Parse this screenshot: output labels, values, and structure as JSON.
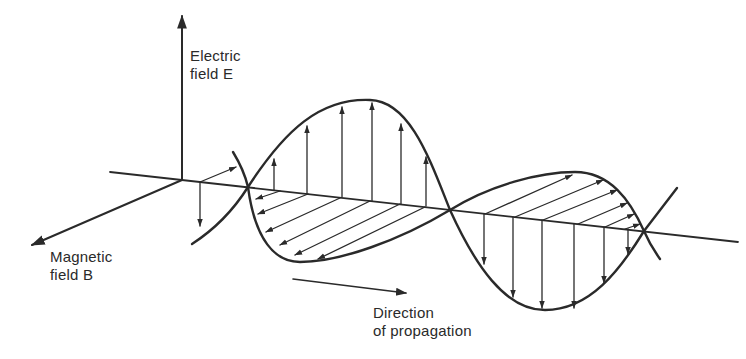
{
  "figure": {
    "colors": {
      "background": "#ffffff",
      "ink": "#2a2a2a"
    }
  },
  "labels": {
    "electric": {
      "line1": "Electric",
      "line2": "field E"
    },
    "magnetic": {
      "line1": "Magnetic",
      "line2": "field B"
    },
    "propagation": {
      "line1": "Direction",
      "line2": "of propagation"
    }
  },
  "axes": {
    "electric_axis": "vertical-arrow-up",
    "magnetic_axis": "oblique-arrow-lower-left",
    "propagation_axis": "horizontal-line-left-to-right"
  },
  "wave": {
    "zero_crossings": [
      [
        248,
        187
      ],
      [
        450,
        210
      ],
      [
        644,
        231
      ]
    ],
    "e_field_arrows_up": 6,
    "e_field_arrows_down": 6,
    "b_field_arrows_first_half": 6,
    "b_field_arrows_second_half": 6
  }
}
